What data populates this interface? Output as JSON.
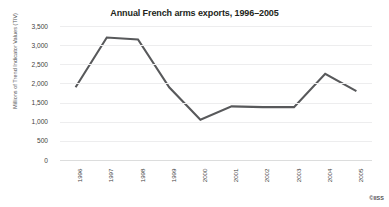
{
  "credit": "©IISS",
  "chart_data": {
    "type": "line",
    "title": "Annual French arms exports, 1996–2005",
    "xlabel": "",
    "ylabel": "Millions of Trend Indicator Values (TIV)",
    "categories": [
      "1996",
      "1997",
      "1998",
      "1999",
      "2000",
      "2001",
      "2002",
      "2003",
      "2004",
      "2005"
    ],
    "values": [
      1900,
      3200,
      3150,
      1900,
      1050,
      1400,
      1380,
      1380,
      2250,
      1800
    ],
    "series": [
      {
        "name": "French arms exports",
        "values": [
          1900,
          3200,
          3150,
          1900,
          1050,
          1400,
          1380,
          1380,
          2250,
          1800
        ]
      }
    ],
    "ylim": [
      0,
      3500
    ],
    "ytick_labels": [
      "3,500",
      "3,000",
      "2,500",
      "2,000",
      "1,500",
      "1,000",
      "500",
      "0"
    ],
    "ytick_values": [
      3500,
      3000,
      2500,
      2000,
      1500,
      1000,
      500,
      0
    ],
    "grid": true,
    "legend": "none",
    "line_color": "#58595b",
    "background_color": "#ffffff"
  }
}
